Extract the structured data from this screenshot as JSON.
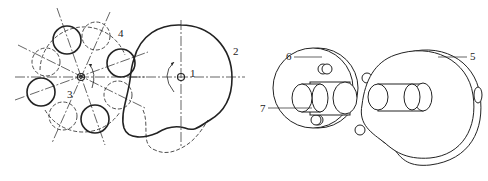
{
  "diagram": {
    "type": "mechanical-drawing",
    "left_view": {
      "description": "2D schematic of cam (2) on shaft (1) driving star wheel (3) with rollers (4)",
      "labels": [
        {
          "id": "1",
          "text": "1",
          "x": 190,
          "y": 77
        },
        {
          "id": "2",
          "text": "2",
          "x": 233,
          "y": 55
        },
        {
          "id": "3",
          "text": "3",
          "x": 67,
          "y": 98
        },
        {
          "id": "4",
          "text": "4",
          "x": 118,
          "y": 37
        }
      ]
    },
    "right_view": {
      "description": "3D isometric view of cam disc (5), roller wheel (6) and shaft (7)",
      "labels": [
        {
          "id": "5",
          "text": "5",
          "x": 470,
          "y": 60
        },
        {
          "id": "6",
          "text": "6",
          "x": 286,
          "y": 60
        },
        {
          "id": "7",
          "text": "7",
          "x": 262,
          "y": 112
        }
      ]
    }
  }
}
